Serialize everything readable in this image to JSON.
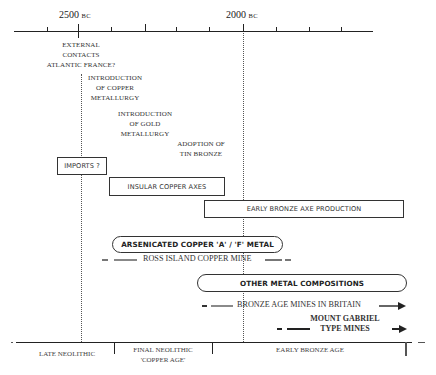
{
  "top_axis": {
    "labels": [
      {
        "year": "2500",
        "era": "BC"
      },
      {
        "year": "2000",
        "era": "BC"
      }
    ]
  },
  "events": [
    {
      "lines": [
        "EXTERNAL",
        "CONTACTS",
        "ATLANTIC FRANCE?"
      ]
    },
    {
      "lines": [
        "INTRODUCTION",
        "OF COPPER",
        "METALLURGY"
      ]
    },
    {
      "lines": [
        "INTRODUCTION",
        "OF GOLD",
        "METALLURGY"
      ]
    },
    {
      "lines": [
        "ADOPTION OF",
        "TIN BRONZE"
      ]
    }
  ],
  "boxes": [
    {
      "label": "IMPORTS ?"
    },
    {
      "label": "INSULAR COPPER AXES"
    },
    {
      "label": "EARLY BRONZE AXE PRODUCTION"
    }
  ],
  "pills": [
    {
      "label": "ARSENICATED COPPER 'A' / 'F' METAL"
    },
    {
      "label": "OTHER METAL COMPOSITIONS"
    }
  ],
  "mines": [
    {
      "label": "ROSS ISLAND COPPER MINE"
    },
    {
      "label": "BRONZE AGE MINES IN BRITAIN"
    },
    {
      "lines": [
        "MOUNT GABRIEL",
        "TYPE MINES"
      ]
    }
  ],
  "periods": [
    {
      "lines": [
        "LATE NEOLITHIC"
      ]
    },
    {
      "lines": [
        "FINAL NEOLITHIC",
        "'COPPER AGE'"
      ]
    },
    {
      "lines": [
        "EARLY BRONZE AGE"
      ]
    }
  ],
  "colors": {
    "line": "#222222",
    "grey_bar": "#8a8a8a",
    "dotted": "#555555"
  }
}
